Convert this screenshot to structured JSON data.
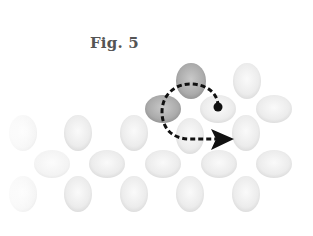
{
  "figure": {
    "caption": "Fig. 5"
  },
  "colors": {
    "highlight_atom": "#a8a8a8",
    "lattice_atom": "#e4e4e4",
    "path": "#111111"
  },
  "atoms": {
    "highlighted": [
      {
        "id": "top",
        "cx": 191,
        "cy": 81
      },
      {
        "id": "left",
        "cx": 163,
        "cy": 109
      }
    ],
    "upper_layer": [
      {
        "id": "dot-atom",
        "cx": 218,
        "cy": 109
      },
      {
        "id": "upper-right-1",
        "cx": 247,
        "cy": 81
      },
      {
        "id": "upper-right-2",
        "cx": 274,
        "cy": 109
      }
    ],
    "row_a": [
      23,
      78,
      134,
      190,
      246
    ],
    "row_b": [
      52,
      107,
      163,
      219,
      274
    ],
    "row_c": [
      23,
      78,
      134,
      190,
      246
    ]
  },
  "path": {
    "start": {
      "x": 218,
      "y": 106
    },
    "end_arrow_tip": {
      "x": 232,
      "y": 139
    }
  }
}
